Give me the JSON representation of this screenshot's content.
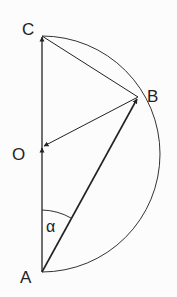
{
  "diagram": {
    "labels": {
      "C": "C",
      "B": "B",
      "O": "O",
      "A": "A",
      "alpha": "α"
    },
    "elements": [
      "semicircle through A, B, C centered at O",
      "vector A→C (through O)",
      "vector A→B",
      "vector B→O",
      "chord C–B",
      "angle α between AC and AB at A"
    ]
  }
}
